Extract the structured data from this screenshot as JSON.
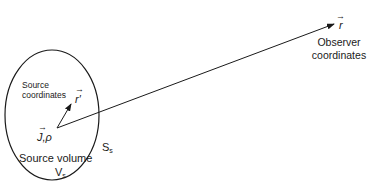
{
  "diagram": {
    "observer_vector_label": "r",
    "observer_label_line1": "Observer",
    "observer_label_line2": "coordinates",
    "source_vector_label": "r′",
    "source_coords_line1": "Source",
    "source_coords_line2": "coordinates",
    "current_density_label": "J,ρ",
    "source_volume_label": "Source volume",
    "volume_symbol": "V",
    "volume_subscript": "s",
    "surface_symbol": "S",
    "surface_subscript": "s",
    "vector_arrow_glyph": "→"
  }
}
